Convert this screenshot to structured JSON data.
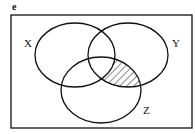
{
  "figure": {
    "panel_label": "e",
    "universe": {
      "x": 11,
      "y": 15,
      "width": 181,
      "height": 113
    },
    "sets": [
      {
        "id": "X",
        "label": "X",
        "cx": 75,
        "cy": 55,
        "rx": 40,
        "ry": 32,
        "label_x": 24,
        "label_y": 47
      },
      {
        "id": "Y",
        "label": "Y",
        "cx": 128,
        "cy": 55,
        "rx": 40,
        "ry": 32,
        "label_x": 172,
        "label_y": 47
      },
      {
        "id": "Z",
        "label": "Z",
        "cx": 101,
        "cy": 90,
        "rx": 40,
        "ry": 33,
        "label_x": 143,
        "label_y": 114
      }
    ],
    "shaded_region": "(Y ∩ Z) \\ X",
    "shading_style": "diagonal-hatch",
    "colors": {
      "stroke": "#111111",
      "background": "#ffffff",
      "hatch": "#222222"
    }
  }
}
